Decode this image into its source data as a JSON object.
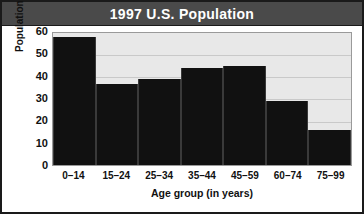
{
  "header": {
    "title": "1997 U.S. Population"
  },
  "chart_data": {
    "type": "bar",
    "title": "1997 U.S. Population",
    "xlabel": "Age group (in years)",
    "ylabel": "Population (in millions)",
    "categories": [
      "0–14",
      "15–24",
      "25–34",
      "35–44",
      "45–59",
      "60–74",
      "75–99"
    ],
    "values": [
      58,
      37,
      39,
      44,
      45,
      29,
      16
    ],
    "yticks": [
      60,
      50,
      40,
      30,
      20,
      10,
      0
    ],
    "ylim": [
      0,
      60
    ],
    "grid": true,
    "legend": null,
    "colors": {
      "bar": "#111111",
      "plot_background": "#e8e8e8",
      "gridline": "#c9c9c9",
      "header_background": "#4a4a4a",
      "header_text": "#ffffff",
      "frame_border": "#1a1a1a"
    }
  }
}
